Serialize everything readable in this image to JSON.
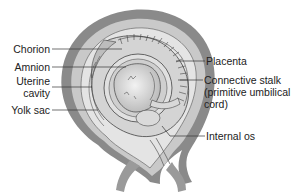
{
  "diagram": {
    "labels": {
      "chorion": "Chorion",
      "amnion": "Amnion",
      "uterine_cavity_line1": "Uterine",
      "uterine_cavity_line2": "cavity",
      "yolk_sac": "Yolk sac",
      "placenta": "Placenta",
      "connective_stalk_line1": "Connective stalk",
      "connective_stalk_line2": "(primitive umbilical",
      "connective_stalk_line3": "cord)",
      "internal_os": "Internal os"
    },
    "colors": {
      "uterine_wall": "#8c8c8c",
      "uterine_wall_light": "#c4c4c4",
      "cavity": "#e6e6e6",
      "line": "#333333"
    }
  }
}
